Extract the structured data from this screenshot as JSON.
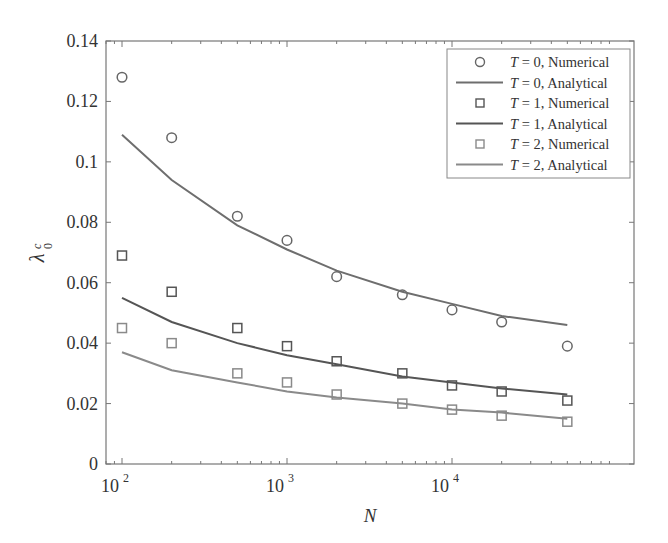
{
  "chart_data": {
    "type": "line",
    "title": "",
    "xlabel": "N",
    "ylabel": "λ0^c",
    "xscale": "log",
    "xlim": [
      80,
      60000
    ],
    "ylim": [
      0,
      0.14
    ],
    "x": [
      100,
      200,
      500,
      1000,
      2000,
      5000,
      10000,
      20000,
      50000
    ],
    "x_ticks": [
      100,
      1000,
      10000
    ],
    "x_tick_labels": [
      "10",
      "10",
      "10"
    ],
    "x_tick_exponents": [
      "2",
      "3",
      "4"
    ],
    "y_ticks": [
      0,
      0.02,
      0.04,
      0.06,
      0.08,
      0.1,
      0.12,
      0.14
    ],
    "y_tick_labels": [
      "0",
      "0.02",
      "0.04",
      "0.06",
      "0.08",
      "0.1",
      "0.12",
      "0.14"
    ],
    "grid": false,
    "legend_position": "upper right",
    "series": [
      {
        "name": "T = 0, Numerical",
        "var": "T",
        "label_rest": " = 0, Numerical",
        "kind": "marker",
        "marker": "circle",
        "color": "#666666",
        "values": [
          0.128,
          0.108,
          0.082,
          0.074,
          0.062,
          0.056,
          0.051,
          0.047,
          0.039
        ]
      },
      {
        "name": "T = 0, Analytical",
        "var": "T",
        "label_rest": " = 0, Analytical",
        "kind": "line",
        "color": "#6e6e6e",
        "values": [
          0.109,
          0.094,
          0.079,
          0.071,
          0.064,
          0.057,
          0.053,
          0.049,
          0.046
        ]
      },
      {
        "name": "T = 1, Numerical",
        "var": "T",
        "label_rest": " = 1, Numerical",
        "kind": "marker",
        "marker": "square",
        "color": "#555555",
        "values": [
          0.069,
          0.057,
          0.045,
          0.039,
          0.034,
          0.03,
          0.026,
          0.024,
          0.021
        ]
      },
      {
        "name": "T = 1, Analytical",
        "var": "T",
        "label_rest": " = 1, Analytical",
        "kind": "line",
        "color": "#555555",
        "values": [
          0.055,
          0.047,
          0.04,
          0.036,
          0.033,
          0.029,
          0.027,
          0.025,
          0.023
        ]
      },
      {
        "name": "T = 2, Numerical",
        "var": "T",
        "label_rest": " = 2, Numerical",
        "kind": "marker",
        "marker": "square",
        "color": "#8a8a8a",
        "values": [
          0.045,
          0.04,
          0.03,
          0.027,
          0.023,
          0.02,
          0.018,
          0.016,
          0.014
        ]
      },
      {
        "name": "T = 2, Analytical",
        "var": "T",
        "label_rest": " = 2, Analytical",
        "kind": "line",
        "color": "#8a8a8a",
        "values": [
          0.037,
          0.031,
          0.027,
          0.024,
          0.022,
          0.02,
          0.018,
          0.017,
          0.015
        ]
      }
    ]
  }
}
